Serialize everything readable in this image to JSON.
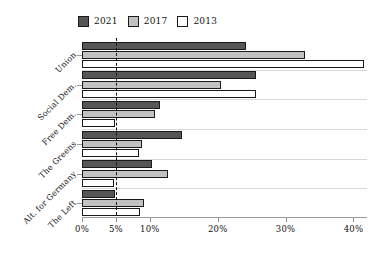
{
  "chart_data": {
    "type": "bar",
    "orientation": "horizontal",
    "title": "",
    "xlabel": "",
    "ylabel": "",
    "categories": [
      "Union",
      "Social Dem.",
      "Free Dem.",
      "The Greens",
      "Alt. for Germany",
      "The Left"
    ],
    "series": [
      {
        "name": "2021",
        "color": "#565656",
        "values": [
          24.1,
          25.7,
          11.5,
          14.8,
          10.3,
          4.9
        ]
      },
      {
        "name": "2017",
        "color": "#c2c2c2",
        "values": [
          32.9,
          20.5,
          10.7,
          8.9,
          12.6,
          9.2
        ]
      },
      {
        "name": "2013",
        "color": "#ffffff",
        "values": [
          41.5,
          25.7,
          4.8,
          8.4,
          4.7,
          8.6
        ]
      }
    ],
    "xlim": [
      0,
      42
    ],
    "xticks": [
      0,
      5,
      10,
      20,
      30,
      40
    ],
    "xtick_labels": [
      "0%",
      "5%",
      "10%",
      "20%",
      "30%",
      "40%"
    ],
    "grid": true,
    "legend_position": "top",
    "annotations": [
      {
        "type": "vline",
        "value": 5,
        "style": "dashed",
        "label": "5% threshold"
      }
    ]
  },
  "legend": {
    "entries": [
      {
        "label": "2021",
        "color": "#565656"
      },
      {
        "label": "2017",
        "color": "#c2c2c2"
      },
      {
        "label": "2013",
        "color": "#ffffff"
      }
    ]
  }
}
